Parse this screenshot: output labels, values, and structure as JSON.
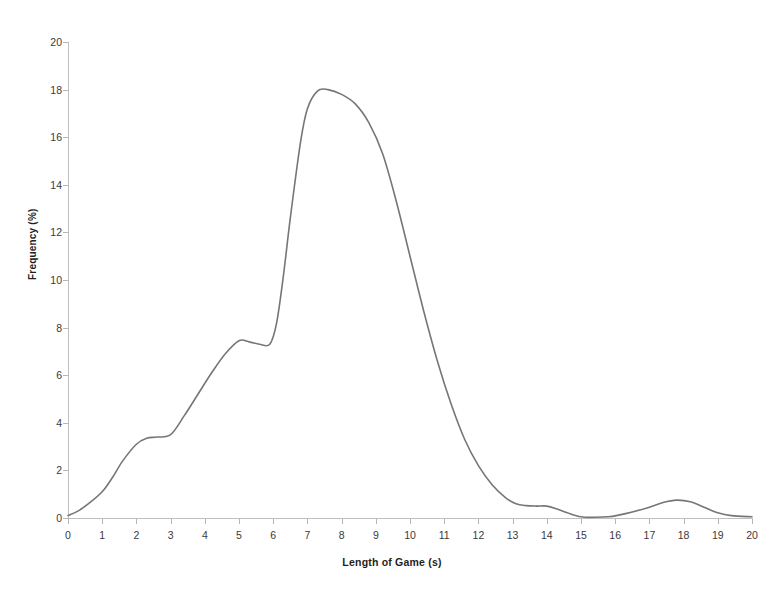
{
  "chart_data": {
    "type": "line",
    "title": "",
    "subtitle": "",
    "xlabel": "Length of Game (s)",
    "ylabel": "Frequency (%)",
    "xlim": [
      0,
      20
    ],
    "ylim": [
      0,
      20
    ],
    "xticks": [
      0,
      1,
      2,
      3,
      4,
      5,
      6,
      7,
      8,
      9,
      10,
      11,
      12,
      13,
      14,
      15,
      16,
      17,
      18,
      19,
      20
    ],
    "yticks": [
      0,
      2,
      4,
      6,
      8,
      10,
      12,
      14,
      16,
      18,
      20
    ],
    "xtick_labels": [
      "0",
      "1",
      "2",
      "3",
      "4",
      "5",
      "6",
      "7",
      "8",
      "9",
      "10",
      "11",
      "12",
      "13",
      "14",
      "15",
      "16",
      "17",
      "18",
      "19",
      "20"
    ],
    "ytick_labels": [
      "0",
      "2",
      "4",
      "6",
      "8",
      "10",
      "12",
      "14",
      "16",
      "18",
      "20"
    ],
    "grid": false,
    "legend": false,
    "legend_position": "none",
    "line_color": "#767676",
    "line_width": 1.6,
    "series": [
      {
        "name": "Length of Game frequency",
        "x": [
          0.0,
          0.3,
          0.6,
          1.0,
          1.3,
          1.6,
          2.0,
          2.3,
          2.6,
          3.0,
          3.4,
          3.8,
          4.2,
          4.6,
          5.0,
          5.3,
          5.6,
          5.9,
          6.1,
          6.3,
          6.5,
          6.8,
          7.0,
          7.3,
          7.6,
          8.0,
          8.4,
          8.8,
          9.2,
          9.6,
          10.0,
          10.4,
          10.8,
          11.2,
          11.6,
          12.0,
          12.4,
          12.8,
          13.1,
          13.4,
          13.7,
          14.0,
          14.3,
          14.6,
          15.0,
          15.4,
          15.8,
          16.1,
          16.5,
          17.0,
          17.4,
          17.8,
          18.2,
          18.6,
          19.0,
          19.4,
          20.0
        ],
        "y": [
          0.1,
          0.3,
          0.6,
          1.1,
          1.7,
          2.4,
          3.1,
          3.35,
          3.4,
          3.5,
          4.3,
          5.2,
          6.1,
          6.9,
          7.45,
          7.4,
          7.3,
          7.3,
          8.2,
          10.2,
          12.6,
          15.8,
          17.2,
          17.95,
          18.0,
          17.8,
          17.4,
          16.6,
          15.3,
          13.3,
          11.0,
          8.7,
          6.6,
          4.8,
          3.3,
          2.2,
          1.4,
          0.85,
          0.6,
          0.52,
          0.5,
          0.5,
          0.38,
          0.22,
          0.05,
          0.03,
          0.05,
          0.12,
          0.25,
          0.45,
          0.65,
          0.75,
          0.68,
          0.45,
          0.22,
          0.1,
          0.05
        ]
      }
    ],
    "annotations": [],
    "key_points": {
      "peak_value": 18.0,
      "peak_x": 7.5,
      "shoulder_value": 7.45,
      "shoulder_x": 5.0,
      "minor_step_value": 3.4,
      "minor_step_x": 2.6,
      "tail_bump_1_value": 0.5,
      "tail_bump_1_x": 13.8,
      "tail_bump_2_value": 0.75,
      "tail_bump_2_x": 17.8
    }
  },
  "axes": {
    "x_title": "Length of Game (s)",
    "y_title": "Frequency (%)"
  },
  "style": {
    "background": "#ffffff",
    "axis_color": "#bfbfbf",
    "tick_color": "#b5b5b5",
    "text_color": "#3a3a3a",
    "curve_color": "#767676"
  }
}
